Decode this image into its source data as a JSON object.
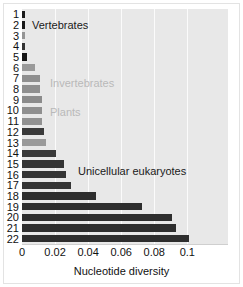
{
  "chart_data": {
    "type": "bar",
    "orientation": "horizontal",
    "title": "",
    "xlabel": "Nucleotide diversity",
    "ylabel": "",
    "xlim": [
      0,
      0.1246
    ],
    "xticks": [
      0,
      0.02,
      0.04,
      0.06,
      0.08,
      0.1
    ],
    "xticklabels": [
      "0",
      "0.02",
      "0.04",
      "0.06",
      "0.08",
      "0.1"
    ],
    "grid": "vertical",
    "legend": "none",
    "categories": [
      "1",
      "2",
      "3",
      "4",
      "5",
      "6",
      "7",
      "8",
      "9",
      "10",
      "11",
      "12",
      "13",
      "14",
      "15",
      "16",
      "17",
      "18",
      "19",
      "20",
      "21",
      "22"
    ],
    "values": [
      0.0018,
      0.0017,
      0.0019,
      0.002,
      0.003,
      0.008,
      0.0109,
      0.011,
      0.0118,
      0.012,
      0.0121,
      0.0131,
      0.0144,
      0.0203,
      0.0253,
      0.0267,
      0.0295,
      0.0447,
      0.0727,
      0.0908,
      0.0931,
      0.1012
    ],
    "bar_colors": [
      "#1a1a1a",
      "#1a1a1a",
      "#949494",
      "#333333",
      "#141414",
      "#9a9a9a",
      "#8f8f8f",
      "#8f8f8f",
      "#8b8b8b",
      "#8f8f8f",
      "#919191",
      "#3a3a3a",
      "#9a9a9a",
      "#3a3a3a",
      "#343434",
      "#343434",
      "#343434",
      "#2e2e2e",
      "#2e2e2e",
      "#2e2e2e",
      "#2e2e2e",
      "#2e2e2e"
    ],
    "annotations": [
      {
        "text": "Vertebrates",
        "x_px": 32,
        "y_px": 20,
        "color": "#1a1a1a"
      },
      {
        "text": "Invertebrates",
        "x_px": 50,
        "y_px": 78,
        "color": "#b9b9b9"
      },
      {
        "text": "Plants",
        "x_px": 50,
        "y_px": 107,
        "color": "#b9b9b9"
      },
      {
        "text": "Unicellular eukaryotes",
        "x_px": 78,
        "y_px": 166,
        "color": "#1a1a1a"
      }
    ],
    "plot_background": "#e8e8e8",
    "gridline_color": "#fbfbfb"
  }
}
